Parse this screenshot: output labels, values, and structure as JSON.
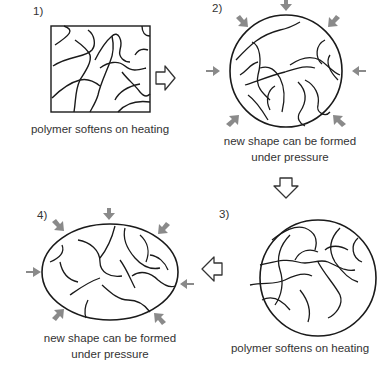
{
  "diagram": {
    "steps": [
      {
        "number": "1)",
        "shape": "square",
        "caption": "polymer softens on heating"
      },
      {
        "number": "2)",
        "shape": "circle",
        "caption_line1": "new shape can be formed",
        "caption_line2": "under pressure"
      },
      {
        "number": "3)",
        "shape": "circle",
        "caption": "polymer softens on heating"
      },
      {
        "number": "4)",
        "shape": "ellipse",
        "caption_line1": "new shape can be formed",
        "caption_line2": "under pressure"
      }
    ],
    "flow_arrows": [
      "1-to-2 right",
      "2-to-3 down",
      "3-to-4 left"
    ],
    "colors": {
      "line": "#1a1a1a",
      "pressure_arrow": "#8a8a8a"
    }
  }
}
